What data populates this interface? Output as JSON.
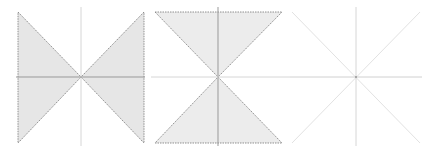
{
  "diagram": {
    "type": "three-panel cone regions",
    "colors": {
      "fill": "#e6e6e6",
      "boundary": "#777777",
      "axis_dark": "#999999",
      "axis_light": "#d6d6d6",
      "diagonal_light": "#e2e2e2"
    },
    "panels": [
      {
        "id": "left",
        "description": "Shaded left and right wedges (horizontal bowtie)",
        "center": [
          81,
          77
        ],
        "box": {
          "x1": 18,
          "y1": 12,
          "x2": 144,
          "y2": 143
        },
        "shaded_regions": [
          "left",
          "right"
        ]
      },
      {
        "id": "middle",
        "description": "Shaded top and bottom wedges (hourglass)",
        "center": [
          218,
          77
        ],
        "box": {
          "x1": 155,
          "y1": 12,
          "x2": 282,
          "y2": 143
        },
        "shaded_regions": [
          "top",
          "bottom"
        ]
      },
      {
        "id": "right",
        "description": "Axes and diagonals only, no shading",
        "center": [
          356,
          77
        ],
        "box": {
          "x1": 292,
          "y1": 12,
          "x2": 420,
          "y2": 143
        },
        "shaded_regions": []
      }
    ]
  }
}
